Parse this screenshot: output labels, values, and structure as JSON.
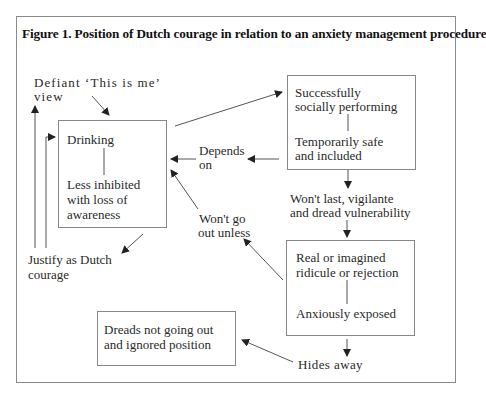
{
  "figure": {
    "title": "Figure 1.  Position of Dutch courage in relation to an anxiety management procedure"
  },
  "nodes": {
    "drinking_box": {
      "top": "Drinking",
      "bottom_lines": [
        "Less inhibited",
        "with loss of",
        "awareness"
      ]
    },
    "success_box": {
      "top_lines": [
        "Successfully",
        "socially performing"
      ],
      "bottom_lines": [
        "Temporarily safe",
        "and included"
      ]
    },
    "ridicule_box": {
      "top_lines": [
        "Real or imagined",
        "ridicule or rejection"
      ],
      "bottom": "Anxiously exposed"
    },
    "dreads_box": {
      "lines": [
        "Dreads not going out",
        "and ignored position"
      ]
    }
  },
  "labels": {
    "defiant": [
      "Defiant ‘This is me’",
      "view"
    ],
    "justify": [
      "Justify as Dutch",
      "courage"
    ],
    "depends": [
      "Depends",
      "on"
    ],
    "wont_go_out": [
      "Won't go",
      "out unless"
    ],
    "wont_last": [
      "Won't last, vigilante",
      "and dread vulnerability"
    ],
    "hides_away": "Hides away"
  },
  "colors": {
    "line": "#555555",
    "box_border": "#888888",
    "text": "#2a2a2a"
  }
}
